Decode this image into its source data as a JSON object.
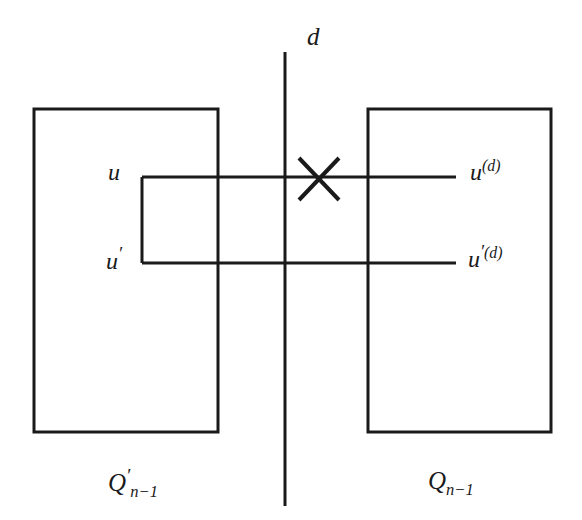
{
  "figure": {
    "background_color": "#ffffff",
    "stroke_color": "#1a1a1a"
  },
  "labels": {
    "dimension": {
      "text": "d"
    },
    "u": {
      "base": "u"
    },
    "u_prime": {
      "base": "u",
      "prime": "′"
    },
    "u_d": {
      "base": "u",
      "sup": "(d)"
    },
    "u_prime_d": {
      "base": "u",
      "prime": "′",
      "sup": "(d)"
    },
    "q_prime_n_minus_1": {
      "base": "Q",
      "prime": "′",
      "sub": "n−1"
    },
    "q_n_minus_1": {
      "base": "Q",
      "sub": "n−1"
    }
  },
  "geometry": {
    "divider_line": {
      "x": 285,
      "y1": 52,
      "y2": 506,
      "stroke_width": 3
    },
    "left_box": {
      "x": 34,
      "y": 109,
      "width": 184,
      "height": 323,
      "stroke_width": 3
    },
    "right_box": {
      "x": 368,
      "y": 109,
      "width": 183,
      "height": 323,
      "stroke_width": 3
    },
    "edge_u": {
      "x1": 142,
      "y": 177,
      "x2": 456,
      "stroke_width": 3
    },
    "edge_u_prime": {
      "x1": 142,
      "y": 263,
      "x2": 456,
      "stroke_width": 3
    },
    "inner_left_edge": {
      "x": 142,
      "y1": 177,
      "y2": 263,
      "stroke_width": 3
    },
    "cross_mark": {
      "cx": 319,
      "cy": 179,
      "half_width": 20,
      "half_height": 21,
      "stroke_width": 4
    }
  }
}
